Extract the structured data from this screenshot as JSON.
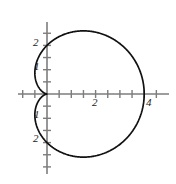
{
  "chart_data": {
    "type": "line",
    "title": "",
    "subtitle": "",
    "xlabel": "",
    "ylabel": "",
    "curve_name": "cardioid",
    "polar_equation": "r = 2(1 + cos(theta))",
    "coordinate_system": "polar curve drawn on cartesian axes",
    "grid": false,
    "legend": null,
    "xlim": [
      -1.2,
      5.05
    ],
    "ylim": [
      -3.75,
      3.0
    ],
    "x_axis": {
      "labels": [
        "2",
        "4"
      ],
      "label_values": [
        2,
        4
      ],
      "tick_values": [
        -1,
        -0.5,
        0.5,
        1,
        1.5,
        2,
        2.5,
        3,
        3.5,
        4,
        4.5
      ],
      "tick_interval": 0.5,
      "range": [
        -1.2,
        5.05
      ]
    },
    "y_axis": {
      "labels": [
        "2",
        "1",
        "1",
        "2"
      ],
      "label_values": [
        2,
        1,
        -1,
        -2
      ],
      "tick_values": [
        -3,
        -2.5,
        -2,
        -1.5,
        -1,
        -0.5,
        0.5,
        1,
        1.5,
        2,
        2.5
      ],
      "tick_interval": 0.5,
      "range": [
        -3.75,
        3.0
      ]
    },
    "key_points": {
      "cusp": [
        0,
        0
      ],
      "rightmost": [
        4,
        0
      ],
      "top": [
        1,
        2.6
      ],
      "bottom": [
        1,
        -2.6
      ],
      "y_intercept_upper": [
        0,
        2
      ],
      "y_intercept_lower": [
        0,
        -2
      ],
      "leftmost_x": -0.5
    },
    "series": [
      {
        "name": "r = 2(1 + cos(theta))",
        "color": "#111111",
        "theta_start_deg": 0,
        "theta_end_deg": 360,
        "points_xy": [
          [
            4.0,
            0.0
          ],
          [
            3.96,
            0.35
          ],
          [
            3.85,
            0.69
          ],
          [
            3.67,
            1.01
          ],
          [
            3.42,
            1.29
          ],
          [
            3.12,
            1.54
          ],
          [
            2.78,
            1.73
          ],
          [
            2.41,
            1.88
          ],
          [
            2.02,
            1.98
          ],
          [
            1.63,
            2.02
          ],
          [
            1.25,
            2.02
          ],
          [
            0.9,
            1.97
          ],
          [
            0.59,
            1.88
          ],
          [
            0.32,
            1.75
          ],
          [
            0.11,
            1.6
          ],
          [
            -0.04,
            1.43
          ],
          [
            -0.14,
            1.25
          ],
          [
            -0.2,
            1.06
          ],
          [
            -0.21,
            0.87
          ],
          [
            -0.19,
            0.69
          ],
          [
            -0.15,
            0.52
          ],
          [
            -0.1,
            0.36
          ],
          [
            -0.05,
            0.22
          ],
          [
            -0.01,
            0.1
          ],
          [
            0.0,
            0.0
          ],
          [
            -0.01,
            -0.1
          ],
          [
            -0.05,
            -0.22
          ],
          [
            -0.1,
            -0.36
          ],
          [
            -0.15,
            -0.52
          ],
          [
            -0.19,
            -0.69
          ],
          [
            -0.21,
            -0.87
          ],
          [
            -0.2,
            -1.06
          ],
          [
            -0.14,
            -1.25
          ],
          [
            -0.04,
            -1.43
          ],
          [
            0.11,
            -1.6
          ],
          [
            0.32,
            -1.75
          ],
          [
            0.59,
            -1.88
          ],
          [
            0.9,
            -1.97
          ],
          [
            1.25,
            -2.02
          ],
          [
            1.63,
            -2.02
          ],
          [
            2.02,
            -1.98
          ],
          [
            2.41,
            -1.88
          ],
          [
            2.78,
            -1.73
          ],
          [
            3.12,
            -1.54
          ],
          [
            3.42,
            -1.29
          ],
          [
            3.67,
            -1.01
          ],
          [
            3.85,
            -0.69
          ],
          [
            3.96,
            -0.35
          ],
          [
            4.0,
            0.0
          ]
        ]
      }
    ],
    "style": {
      "axis_color": "#7d7d7d",
      "curve_color": "#111111",
      "background": "#ffffff",
      "label_color": "#1a1a1a"
    }
  },
  "labels": {
    "y_pos_2": "2",
    "y_pos_1": "1",
    "y_neg_1": "1",
    "y_neg_2": "2",
    "x_pos_2": "2",
    "x_pos_4": "4"
  }
}
